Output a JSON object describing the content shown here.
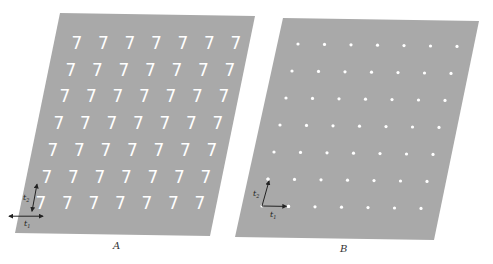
{
  "figure": {
    "background": "#ffffff",
    "panel_fill": "#a9a9a9",
    "motif_color": "#ffffff",
    "arrow_color": "#222222"
  },
  "panels": [
    {
      "id": "A",
      "label": "A",
      "motif": "7",
      "motif_type": "glyph",
      "corners": [
        [
          60,
          13
        ],
        [
          255,
          16
        ],
        [
          210,
          236
        ],
        [
          15,
          233
        ]
      ],
      "lattice": {
        "rows": 7,
        "cols": 7,
        "origin": [
          77,
          42
        ],
        "t1": [
          26.5,
          0
        ],
        "t2": [
          -6,
          26.7
        ]
      },
      "vectors": {
        "t1_label": "t",
        "t1_sub": "1",
        "t2_label": "t",
        "t2_sub": "2"
      },
      "label_pos": [
        113,
        240
      ]
    },
    {
      "id": "B",
      "label": "B",
      "motif": "dot",
      "motif_type": "point",
      "corners": [
        [
          283,
          18
        ],
        [
          479,
          21
        ],
        [
          434,
          240
        ],
        [
          235,
          237
        ]
      ],
      "lattice": {
        "rows": 7,
        "cols": 7,
        "origin": [
          298,
          44
        ],
        "t1": [
          26.5,
          0.4
        ],
        "t2": [
          -6,
          27
        ]
      },
      "vectors": {
        "t1_label": "t",
        "t1_sub": "1",
        "t2_label": "t",
        "t2_sub": "2"
      },
      "label_pos": [
        340,
        243
      ]
    }
  ]
}
